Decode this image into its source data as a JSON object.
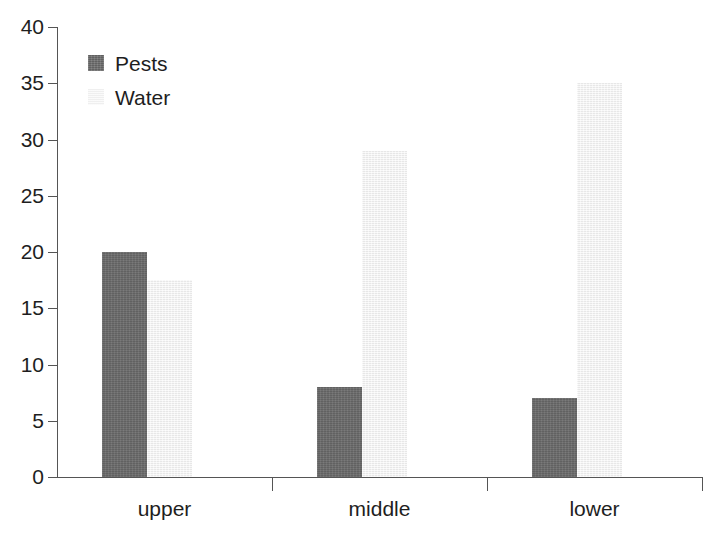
{
  "chart_data": {
    "type": "bar",
    "title": "",
    "subtitle": "",
    "xlabel": "",
    "ylabel": "",
    "categories": [
      "upper",
      "middle",
      "lower"
    ],
    "series": [
      {
        "name": "Pests",
        "values": [
          20,
          8,
          7
        ],
        "color": "#6b6b6b"
      },
      {
        "name": "Water",
        "values": [
          17.5,
          29,
          35
        ],
        "color": "#f2f2f2"
      }
    ],
    "ylim": [
      0,
      40
    ],
    "yticks": [
      0,
      5,
      10,
      15,
      20,
      25,
      30,
      35,
      40
    ],
    "ytick_labels": [
      "0",
      "5",
      "10",
      "15",
      "20",
      "25",
      "30",
      "35",
      "40"
    ],
    "grid": false,
    "legend_position": "top-left",
    "legend_entries": [
      "Pests",
      "Water"
    ]
  },
  "axes": {
    "y_axis_name": "y-axis",
    "x_axis_name": "x-axis"
  }
}
